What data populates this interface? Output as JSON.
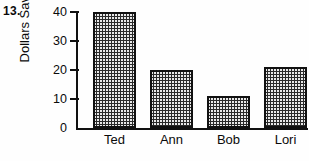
{
  "problem": {
    "number_label": "13."
  },
  "chart_data": {
    "type": "bar",
    "title": "",
    "subtitle": "",
    "xlabel": "",
    "ylabel": "Dollars Saved",
    "categories": [
      "Ted",
      "Ann",
      "Bob",
      "Lori"
    ],
    "values": [
      40,
      20,
      11,
      21
    ],
    "ylim": [
      0,
      40
    ],
    "ytick_labels": [
      "0",
      "10",
      "20",
      "30",
      "40"
    ],
    "ytick_values": [
      0,
      10,
      20,
      30,
      40
    ],
    "grid": false,
    "legend": null,
    "annotations": [],
    "bar_fill": "checkerboard-dot-pattern",
    "colors": {
      "axis": "#111111",
      "bar_border": "#111111",
      "bar_fill": "#e9e9e9",
      "text": "#0a0a0a",
      "background": "#fefefe"
    }
  }
}
